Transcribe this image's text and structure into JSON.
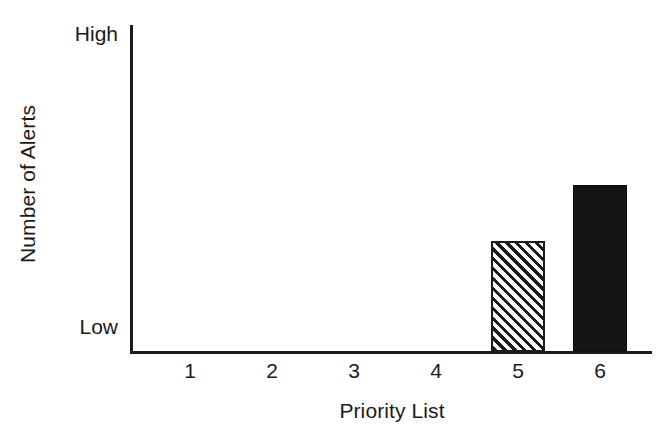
{
  "chart_data": {
    "type": "bar",
    "title": "",
    "subtitle": "",
    "xlabel": "Priority List",
    "ylabel": "Number of Alerts",
    "categories": [
      "1",
      "2",
      "3",
      "4",
      "5",
      "6"
    ],
    "values": [
      0,
      0,
      0,
      0,
      34,
      51
    ],
    "ylim": [
      0,
      100
    ],
    "ytick_labels": [
      "Low",
      "High"
    ],
    "ytick_values": [
      0,
      100
    ],
    "grid": false,
    "legend": null,
    "annotations": [],
    "bar_styles": [
      "none",
      "none",
      "none",
      "none",
      "hatched-diagonal",
      "solid-black"
    ],
    "colors": {
      "axis": "#1b1b1b",
      "text": "#1b1b1b",
      "bar_solid": "#141414",
      "bar_hatch_fill": "#ffffff",
      "bar_hatch_stroke": "#1b1b1b",
      "background": "#ffffff"
    }
  },
  "axis": {
    "y_top_label": "High",
    "y_bottom_label": "Low",
    "y_title": "Number of Alerts",
    "x_title": "Priority List"
  }
}
